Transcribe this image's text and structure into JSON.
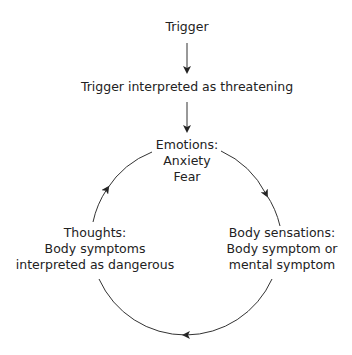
{
  "diagram": {
    "nodes": {
      "trigger": {
        "lines": [
          "Trigger"
        ]
      },
      "interpreted": {
        "lines": [
          "Trigger interpreted as threatening"
        ]
      },
      "emotions": {
        "lines": [
          "Emotions:",
          "Anxiety",
          "Fear"
        ]
      },
      "body_sensations": {
        "lines": [
          "Body sensations:",
          "Body symptom or",
          "mental symptom"
        ]
      },
      "thoughts": {
        "lines": [
          "Thoughts:",
          "Body symptoms",
          "interpreted as dangerous"
        ]
      }
    },
    "edges": [
      {
        "from": "trigger",
        "to": "interpreted",
        "type": "straight-arrow"
      },
      {
        "from": "interpreted",
        "to": "emotions",
        "type": "straight-arrow"
      },
      {
        "from": "emotions",
        "to": "body_sensations",
        "type": "cycle-arc"
      },
      {
        "from": "body_sensations",
        "to": "thoughts",
        "type": "cycle-arc"
      },
      {
        "from": "thoughts",
        "to": "emotions",
        "type": "cycle-arc"
      }
    ],
    "line_color": "#333333"
  }
}
